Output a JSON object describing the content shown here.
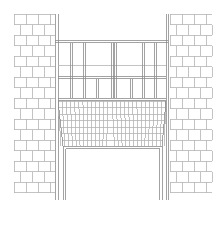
{
  "drawing": {
    "title": "Bay window elevation",
    "type": "architectural-elevation",
    "stroke_color": "#8c8c8c",
    "stroke_light": "#b4b4b4",
    "background": "#ffffff"
  },
  "elements": {
    "left_pier": {
      "label": "Left brick pier",
      "x": 14,
      "y": 14,
      "w": 41,
      "h": 186
    },
    "right_pier": {
      "label": "Right brick pier",
      "x": 170,
      "y": 14,
      "w": 42,
      "h": 186
    },
    "window": {
      "label": "Bay window",
      "x": 55,
      "y": 40,
      "w": 113,
      "h": 58,
      "mullions": [
        58,
        70,
        83,
        111,
        114,
        142,
        154,
        165
      ],
      "transom_y": 76
    },
    "corbel": {
      "label": "Brick corbel",
      "top_y": 98,
      "bottom_y": 146
    },
    "opening": {
      "label": "Opening",
      "x": 63,
      "y": 146,
      "w": 100,
      "h": 54
    }
  }
}
